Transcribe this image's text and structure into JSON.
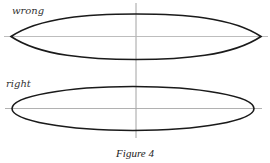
{
  "figure": {
    "caption": "Figure 4",
    "panels": [
      {
        "label": "wrong",
        "shape": "pointed-lens",
        "description": "Shape with sharp pointed ends (incorrect ellipse drawing)"
      },
      {
        "label": "right",
        "shape": "ellipse",
        "description": "Ellipse with rounded ends (correct drawing)"
      }
    ]
  },
  "colors": {
    "outline": "#1a1a1a",
    "axis_horizontal": "#b0b0b0",
    "axis_vertical": "#8a8a8a",
    "background": "#ffffff"
  }
}
